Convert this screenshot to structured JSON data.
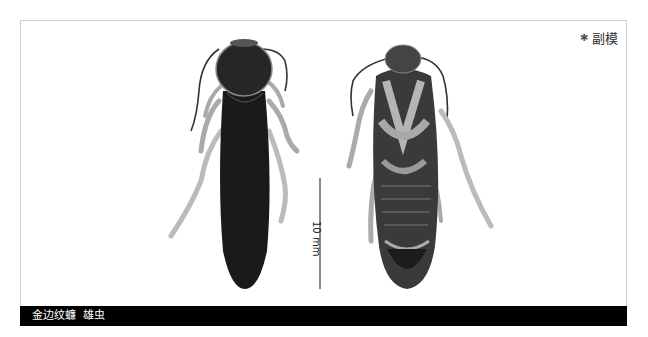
{
  "plate": {
    "badge": {
      "icon": "star-icon",
      "symbol": "✱",
      "label": "副模"
    },
    "scale_bar": {
      "label": "10 mm"
    },
    "specimens": [
      {
        "view": "dorsal",
        "description": "dark cockroach, dorsal view"
      },
      {
        "view": "ventral",
        "description": "cockroach, ventral view"
      }
    ],
    "caption": {
      "text": "金边纹蠊  雄虫"
    }
  },
  "colors": {
    "caption_bg": "#000000",
    "caption_text": "#ffffff",
    "scale_bar": "#8a8a8a",
    "border": "#d0d0d0"
  }
}
